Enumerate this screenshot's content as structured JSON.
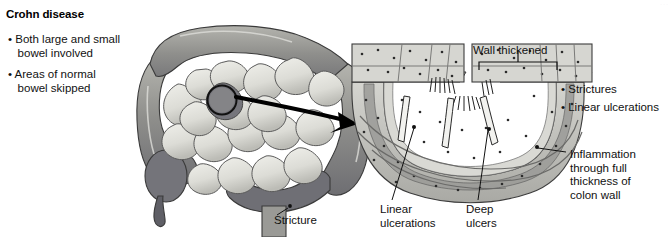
{
  "figure": {
    "title": "Crohn disease",
    "width": 672,
    "height": 237,
    "background": "#ffffff",
    "faint_top_text": "· · ·"
  },
  "left_panel": {
    "bullets": [
      "• Both large and small\n   bowel involved",
      "• Areas of normal\n   bowel skipped"
    ],
    "callouts": [
      {
        "name": "stricture",
        "text": "Stricture"
      }
    ]
  },
  "right_panel": {
    "bracket_label": "Wall thickened",
    "bullets": [
      "• Strictures",
      "• Linear ulcerations"
    ],
    "callouts": [
      {
        "name": "inflammation",
        "text": "Inflammation\nthrough full\nthickness of\ncolon wall"
      },
      {
        "name": "linear-ulcerations",
        "text": "Linear\nulcerations"
      },
      {
        "name": "deep-ulcers",
        "text": "Deep\nulcers"
      }
    ]
  },
  "colors": {
    "ink": "#111111",
    "line": "#1a1a1a",
    "colon_wall": "#9a9a96",
    "colon_wall_dark": "#74747a",
    "colon_highlight": "#cfcfc9",
    "small_bowel": "#e2e2dd",
    "small_bowel_shade": "#b9b9b3",
    "stricture_dark": "#6f6f75",
    "section_fill": "#c9c9c4",
    "section_mucosa": "#d8d8d3",
    "section_muscle": "#9d9d9a",
    "section_serosa": "#8b8b88",
    "arrow": "#000000"
  },
  "diagram_data": {
    "type": "medical-illustration",
    "subject": "Crohn disease of the bowel",
    "views": [
      {
        "name": "whole-bowel-overview",
        "description": "Large intestine (colon) surrounding loops of small bowel, with a magnifier circle over the transverse colon and a narrowed stricture in the sigmoid colon"
      },
      {
        "name": "colon-wall-cross-section",
        "description": "Cut U-shaped segment of colon wall showing full-thickness inflammation, linear ulcerations and deep ulcers, with a bracket marking the thickened wall"
      }
    ],
    "connector": "curved-arrow-from-magnifier-to-cross-section"
  }
}
